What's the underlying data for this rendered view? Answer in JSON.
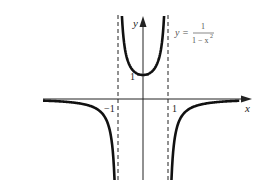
{
  "chart_data": {
    "type": "line",
    "title": "",
    "function": "y = 1/(1 - x^2)",
    "annotation": {
      "lhs": "y =",
      "numerator": "1",
      "denominator": "1 − x",
      "exponent": "2"
    },
    "xlabel": "x",
    "ylabel": "y",
    "tick_labels": {
      "x": [
        "−1",
        "1"
      ],
      "y": [
        "1"
      ]
    },
    "asymptotes": {
      "vertical": [
        -1,
        1
      ],
      "horizontal": [
        0
      ]
    },
    "xlim": [
      -4,
      4.4
    ],
    "ylim": [
      -3.4,
      3.5
    ],
    "grid": false,
    "series": [
      {
        "name": "left branch",
        "x": [
          -4,
          -3,
          -2,
          -1.5,
          -1.25,
          -1.15
        ],
        "y": [
          -0.067,
          -0.125,
          -0.333,
          -0.8,
          -1.78,
          -3.08
        ]
      },
      {
        "name": "middle branch",
        "x": [
          -0.84,
          -0.6,
          -0.3,
          0,
          0.3,
          0.6,
          0.84
        ],
        "y": [
          3.4,
          1.5625,
          1.099,
          1,
          1.099,
          1.5625,
          3.4
        ]
      },
      {
        "name": "right branch",
        "x": [
          1.15,
          1.25,
          1.5,
          2,
          3,
          3.85
        ],
        "y": [
          -3.08,
          -1.78,
          -0.8,
          -0.333,
          -0.125,
          -0.072
        ]
      }
    ],
    "style": {
      "curve_color": "#111111",
      "axis_color": "#222222",
      "asymptote_color": "#222222"
    }
  }
}
